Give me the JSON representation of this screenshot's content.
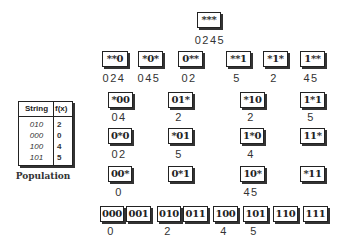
{
  "population_table": {
    "headers": [
      "String",
      "f(x)"
    ],
    "rows": [
      {
        "string": "010",
        "fx": "2"
      },
      {
        "string": "000",
        "fx": "0"
      },
      {
        "string": "100",
        "fx": "4"
      },
      {
        "string": "101",
        "fx": "5"
      }
    ],
    "caption": "Population"
  },
  "lattice": {
    "root": {
      "schema": "***",
      "values": "0245"
    },
    "row1": [
      {
        "schema": "**0",
        "values": "024"
      },
      {
        "schema": "*0*",
        "values": "045"
      },
      {
        "schema": "0**",
        "values": "02"
      },
      {
        "schema": "**1",
        "values": "5"
      },
      {
        "schema": "*1*",
        "values": "2"
      },
      {
        "schema": "1**",
        "values": "45"
      }
    ],
    "row2": [
      {
        "schema": "*00",
        "values": "04"
      },
      {
        "schema": "01*",
        "values": "2"
      },
      {
        "schema": "*10",
        "values": "2"
      },
      {
        "schema": "1*1",
        "values": "5"
      }
    ],
    "row3": [
      {
        "schema": "0*0",
        "values": "02"
      },
      {
        "schema": "*01",
        "values": "5"
      },
      {
        "schema": "1*0",
        "values": "4"
      },
      {
        "schema": "11*",
        "values": ""
      }
    ],
    "row4": [
      {
        "schema": "00*",
        "values": "0"
      },
      {
        "schema": "0*1",
        "values": ""
      },
      {
        "schema": "10*",
        "values": "45"
      },
      {
        "schema": "*11",
        "values": ""
      }
    ],
    "leaves": [
      {
        "schema": "000",
        "values": "0"
      },
      {
        "schema": "001",
        "values": ""
      },
      {
        "schema": "010",
        "values": "2"
      },
      {
        "schema": "011",
        "values": ""
      },
      {
        "schema": "100",
        "values": "4"
      },
      {
        "schema": "101",
        "values": "5"
      },
      {
        "schema": "110",
        "values": ""
      },
      {
        "schema": "111",
        "values": ""
      }
    ]
  }
}
